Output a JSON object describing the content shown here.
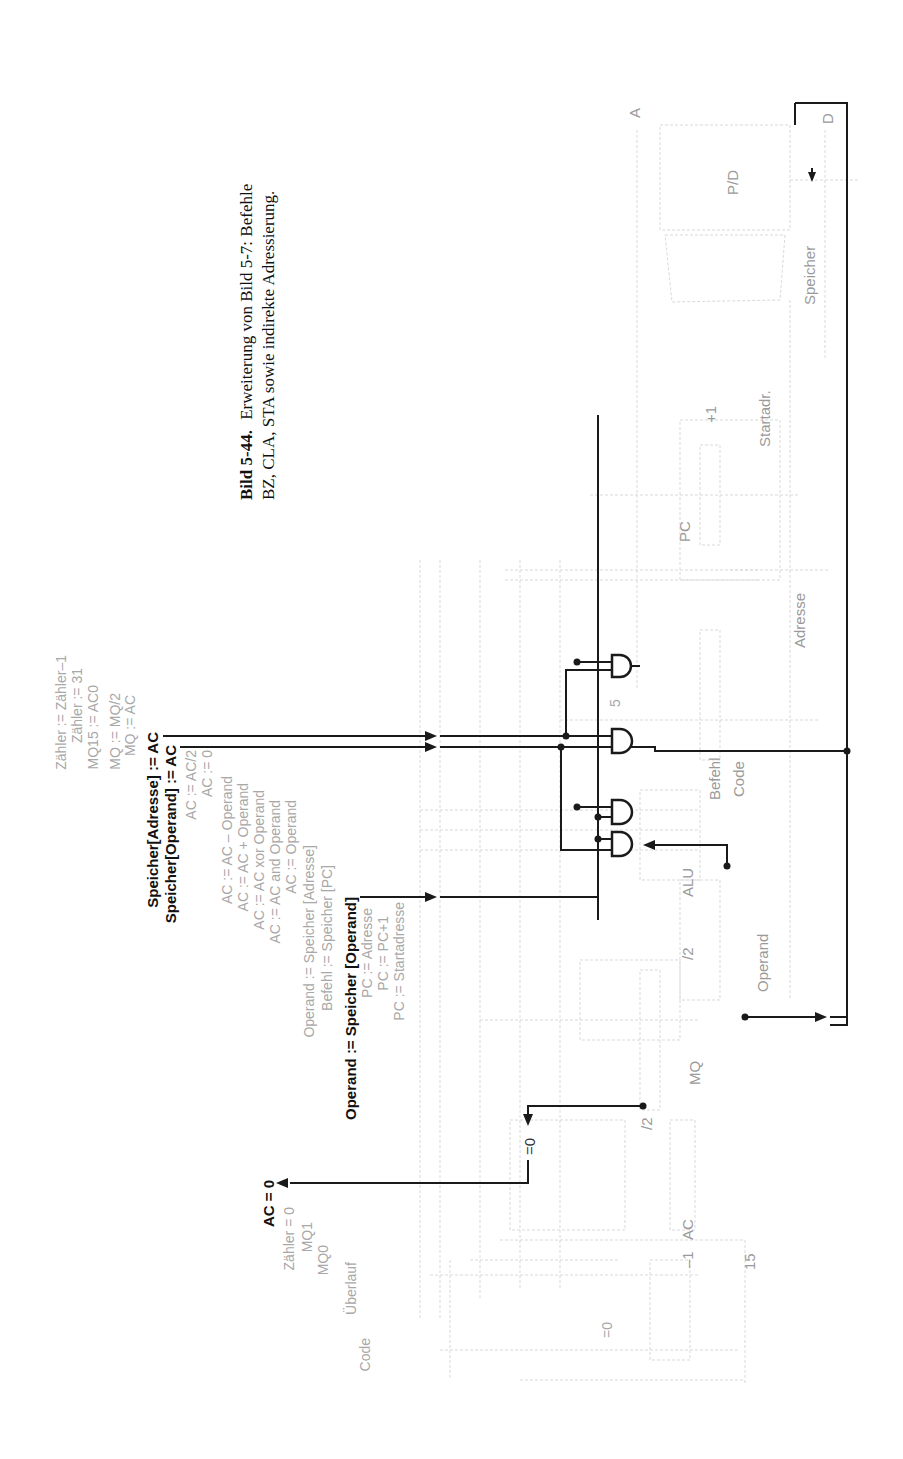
{
  "caption": {
    "figure_number": "Bild 5-44.",
    "line1_rest": "Erweiterung von Bild 5-7: Befehle",
    "line2": "BZ, CLA, STA sowie indirekte Adressierung."
  },
  "control_signals": [
    {
      "text": "Zähler := Zähler–1",
      "bold": false
    },
    {
      "text": "Zähler := 31",
      "bold": false
    },
    {
      "text": "MQ15 := AC0",
      "bold": false
    },
    {
      "text": "MQ := MQ/2",
      "bold": false
    },
    {
      "text": "MQ := AC",
      "bold": false
    },
    {
      "text": "Speicher[Adresse] := AC",
      "bold": true
    },
    {
      "text": "Speicher[Operand] := AC",
      "bold": true
    },
    {
      "text": "AC := AC/2",
      "bold": false
    },
    {
      "text": "AC := 0",
      "bold": false
    },
    {
      "text": "AC := AC – Operand",
      "bold": false
    },
    {
      "text": "AC := AC + Operand",
      "bold": false
    },
    {
      "text": "AC := AC xor Operand",
      "bold": false
    },
    {
      "text": "AC := AC and Operand",
      "bold": false
    },
    {
      "text": "AC := Operand",
      "bold": false
    },
    {
      "text": "Operand := Speicher [Adresse]",
      "bold": false
    },
    {
      "text": "Befehl := Speicher [PC]",
      "bold": false
    },
    {
      "text": "Operand := Speicher [Operand]",
      "bold": true
    },
    {
      "text": "PC := Adresse",
      "bold": false
    },
    {
      "text": "PC := PC+1",
      "bold": false
    },
    {
      "text": "PC := Startadresse",
      "bold": false
    }
  ],
  "status_signals": [
    {
      "text": "AC = 0",
      "bold": true
    },
    {
      "text": "Zähler = 0",
      "bold": false
    },
    {
      "text": "MQ1",
      "bold": false
    },
    {
      "text": "MQ0",
      "bold": false
    },
    {
      "text": "Überlauf",
      "bold": false
    },
    {
      "text": "Code",
      "bold": false
    }
  ],
  "blocks": {
    "speicher": "Speicher",
    "pd": "P/D",
    "port_a": "A",
    "port_d": "D",
    "startadr": "Startadr.",
    "plus_one": "+1",
    "pc": "PC",
    "adresse": "Adresse",
    "befehl": "Befehl",
    "code": "Code",
    "alu": "ALU",
    "operand": "Operand",
    "div2_mq": "/2",
    "mq": "MQ",
    "div2_ac": "/2",
    "ac": "AC",
    "minus_one": "–1",
    "fifteen": "15",
    "eq0_bold": "=0",
    "eq0_gray": "=0",
    "five": "5"
  }
}
